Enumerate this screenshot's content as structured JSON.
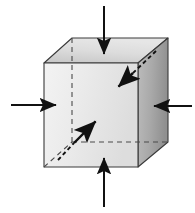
{
  "figure": {
    "type": "technical-line-diagram",
    "background_color": "#ffffff",
    "canvas": {
      "width": 195,
      "height": 213
    }
  },
  "colors": {
    "front_face": "#e9e9e9",
    "front_face_shade_light": "#f2f2f2",
    "front_face_shade_dark": "#d9d9d9",
    "right_face": "#a9a9a9",
    "right_face_shade_light": "#bdbdbd",
    "right_face_shade_dark": "#8f8f8f",
    "top_face": "#d6d6d6",
    "top_face_shade_light": "#e4e4e4",
    "top_face_shade_dark": "#c2c2c2",
    "edge_stroke": "#3a3a3a",
    "hidden_edge_stroke": "#4a4a4a",
    "arrow_stroke": "#111111"
  },
  "cube": {
    "label": "cube-element",
    "front_face": {
      "name": "front-face",
      "points": "44,63 138,63 138,167 44,167"
    },
    "top_face": {
      "name": "top-face",
      "points": "44,63 72,38 168,38 138,63"
    },
    "right_face": {
      "name": "right-face",
      "points": "138,63 168,38 168,142 138,167"
    },
    "hidden_edges": [
      {
        "name": "hidden-vertical-edge",
        "x1": 72,
        "y1": 38,
        "x2": 72,
        "y2": 142
      },
      {
        "name": "hidden-horizontal-edge",
        "x1": 72,
        "y1": 142,
        "x2": 168,
        "y2": 142
      },
      {
        "name": "hidden-depth-edge",
        "x1": 44,
        "y1": 167,
        "x2": 72,
        "y2": 142
      }
    ]
  },
  "arrows": {
    "top": {
      "name": "top-compression-arrow",
      "direction": "down",
      "meaning": "compressive force on top face",
      "tail": {
        "x": 104,
        "y": 6
      },
      "tip": {
        "x": 104,
        "y": 56
      },
      "dashed": false
    },
    "bottom": {
      "name": "bottom-compression-arrow",
      "direction": "up",
      "meaning": "compressive force on bottom face",
      "tail": {
        "x": 104,
        "y": 207
      },
      "tip": {
        "x": 104,
        "y": 156
      },
      "dashed": false
    },
    "left": {
      "name": "left-compression-arrow",
      "direction": "right",
      "meaning": "compressive force on left face",
      "tail": {
        "x": 11,
        "y": 105
      },
      "tip": {
        "x": 58,
        "y": 105
      },
      "dashed": false
    },
    "right": {
      "name": "right-compression-arrow",
      "direction": "left",
      "meaning": "compressive force on right face",
      "tail": {
        "x": 192,
        "y": 106
      },
      "tip": {
        "x": 152,
        "y": 106
      },
      "dashed": false
    },
    "front_diagonal": {
      "name": "front-depth-compression-arrow",
      "direction": "up-right",
      "meaning": "compressive force on front face, into depth",
      "tail": {
        "x": 58,
        "y": 160
      },
      "tip": {
        "x": 97,
        "y": 120
      },
      "dashed_tail": true,
      "dashed_tail_from": {
        "x": 58,
        "y": 160
      },
      "dashed_tail_to": {
        "x": 74,
        "y": 143
      }
    },
    "back_diagonal": {
      "name": "back-depth-compression-arrow",
      "direction": "down-left",
      "meaning": "compressive force on back face, into depth",
      "tail": {
        "x": 156,
        "y": 51
      },
      "tip": {
        "x": 117,
        "y": 88
      },
      "dashed_tail": true,
      "dashed_tail_from": {
        "x": 156,
        "y": 51
      },
      "dashed_tail_to": {
        "x": 133,
        "y": 73
      }
    }
  },
  "annotations": {
    "visible_text": [],
    "note": "No text labels are rendered in this figure."
  }
}
